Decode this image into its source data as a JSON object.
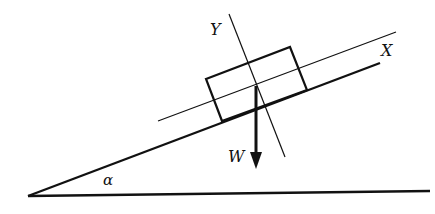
{
  "diagram": {
    "type": "inclined-plane-free-body",
    "labels": {
      "x_axis": "X",
      "y_axis": "Y",
      "weight": "W",
      "angle": "α"
    },
    "colors": {
      "stroke": "#111111",
      "background": "#ffffff"
    }
  }
}
